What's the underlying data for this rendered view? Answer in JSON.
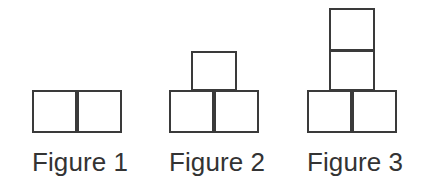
{
  "canvas": {
    "width": 421,
    "height": 191,
    "background_color": "#ffffff"
  },
  "style": {
    "square_stroke_color": "#3a3a3a",
    "square_stroke_width": 2.5,
    "square_fill_color": "#ffffff",
    "caption_color": "#333333",
    "caption_font_size": 26,
    "cell_width": 45,
    "cell_height": 43
  },
  "figures": [
    {
      "id": "figure-1",
      "caption": "Figure 1",
      "square_count": 2,
      "base_row_count": 2,
      "stack_count": 0,
      "group_left": 32,
      "group_width": 90,
      "caption_top": 147,
      "cells": [
        {
          "name": "base-left",
          "left": 0,
          "top": 90,
          "width": 45,
          "height": 43
        },
        {
          "name": "base-right",
          "left": 45,
          "top": 90,
          "width": 45,
          "height": 43
        }
      ]
    },
    {
      "id": "figure-2",
      "caption": "Figure 2",
      "square_count": 3,
      "base_row_count": 2,
      "stack_count": 1,
      "group_left": 169,
      "group_width": 90,
      "caption_top": 147,
      "cells": [
        {
          "name": "base-left",
          "left": 0,
          "top": 90,
          "width": 45,
          "height": 43
        },
        {
          "name": "base-right",
          "left": 45,
          "top": 90,
          "width": 45,
          "height": 43
        },
        {
          "name": "stack-1",
          "left": 22,
          "top": 51,
          "width": 46,
          "height": 40
        }
      ]
    },
    {
      "id": "figure-3",
      "caption": "Figure 3",
      "square_count": 4,
      "base_row_count": 2,
      "stack_count": 2,
      "group_left": 307,
      "group_width": 90,
      "caption_top": 147,
      "cells": [
        {
          "name": "base-left",
          "left": 0,
          "top": 90,
          "width": 45,
          "height": 43
        },
        {
          "name": "base-right",
          "left": 45,
          "top": 90,
          "width": 45,
          "height": 43
        },
        {
          "name": "stack-1",
          "left": 22,
          "top": 50,
          "width": 46,
          "height": 41
        },
        {
          "name": "stack-2",
          "left": 22,
          "top": 8,
          "width": 46,
          "height": 43
        }
      ]
    }
  ],
  "pattern": {
    "type": "growing-square-sequence",
    "square_counts": [
      2,
      3,
      4
    ],
    "common_difference": 1
  }
}
